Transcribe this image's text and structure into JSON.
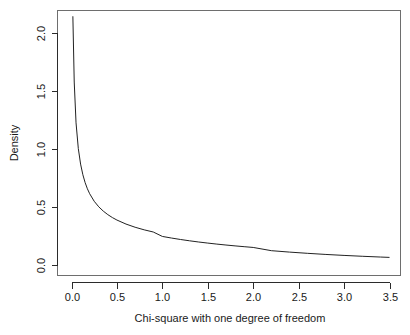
{
  "chart_data": {
    "type": "line",
    "title": "",
    "subtitle": "",
    "xlabel": "Chi-square with one degree of freedom",
    "ylabel": "Density",
    "xlim": [
      -0.06,
      3.62
    ],
    "ylim": [
      -0.02,
      2.18
    ],
    "grid": false,
    "legend": "none",
    "xticks": [
      "0.0",
      "0.5",
      "1.0",
      "1.5",
      "2.0",
      "2.5",
      "3.0",
      "3.5"
    ],
    "xtick_values": [
      0.0,
      0.5,
      1.0,
      1.5,
      2.0,
      2.5,
      3.0,
      3.5
    ],
    "yticks": [
      "0.0",
      "0.5",
      "1.0",
      "1.5",
      "2.0"
    ],
    "ytick_values": [
      0.0,
      0.5,
      1.0,
      1.5,
      2.0
    ],
    "series": [
      {
        "name": "Chi-square df=1 density",
        "x": [
          0.015,
          0.03,
          0.05,
          0.075,
          0.1,
          0.125,
          0.15,
          0.175,
          0.2,
          0.25,
          0.3,
          0.35,
          0.4,
          0.45,
          0.5,
          0.6,
          0.7,
          0.8,
          0.9,
          1.0,
          1.1,
          1.2,
          1.3,
          1.4,
          1.5,
          1.6,
          1.7,
          1.8,
          1.9,
          2.0,
          2.2,
          2.4,
          2.6,
          2.8,
          3.0,
          3.2,
          3.4,
          3.5
        ],
        "y": [
          2.14,
          1.573,
          1.221,
          1.0,
          0.8655,
          0.7736,
          0.7056,
          0.6527,
          0.6101,
          0.545,
          0.4972,
          0.46,
          0.4298,
          0.4046,
          0.3832,
          0.3485,
          0.3212,
          0.2989,
          0.2801,
          0.242,
          0.2281,
          0.2156,
          0.2043,
          0.194,
          0.1846,
          0.1759,
          0.1679,
          0.1605,
          0.1536,
          0.1471,
          0.1191,
          0.1069,
          0.0962,
          0.0867,
          0.0783,
          0.0709,
          0.0643,
          0.0612
        ]
      }
    ]
  },
  "axes": {
    "x_title": "Chi-square with one degree of freedom",
    "y_title": "Density",
    "x_tick_labels": [
      "0.0",
      "0.5",
      "1.0",
      "1.5",
      "2.0",
      "2.5",
      "3.0",
      "3.5"
    ],
    "y_tick_labels": [
      "0.0",
      "0.5",
      "1.0",
      "1.5",
      "2.0"
    ]
  }
}
